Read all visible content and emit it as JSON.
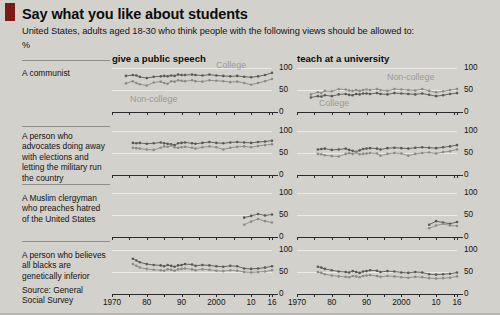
{
  "header": {
    "title": "Say what you like about students",
    "subtitle": "United States, adults aged 18-30 who think people with the following views should be allowed to:",
    "unit": "%"
  },
  "columns": [
    {
      "id": "speech",
      "label": "give a public speech"
    },
    {
      "id": "teach",
      "label": "teach at a university"
    }
  ],
  "source": "Source: General\nSocial Survey",
  "source_line1": "Source: General",
  "source_line2": "Social Survey",
  "colors": {
    "accent": "#7d1a14",
    "background": "#d3d1cb",
    "gridline": "#ebeae6",
    "axis": "#2a2a2a",
    "college": "#5a5954",
    "noncollege": "#8d8b86",
    "series_label": "#9c9a95"
  },
  "axis": {
    "y_ticks": [
      "0",
      "50",
      "100"
    ],
    "y_min": 0,
    "y_max": 100,
    "x_min": 1970,
    "x_max": 2016,
    "x_tick_labels": [
      "1970",
      "80",
      "90",
      "2000",
      "10",
      "16"
    ],
    "x_tick_values": [
      1970,
      1980,
      1990,
      2000,
      2010,
      2016
    ],
    "x_minor_ticks": [
      1970,
      1975,
      1980,
      1985,
      1990,
      1995,
      2000,
      2005,
      2010,
      2015,
      2016
    ]
  },
  "rows": [
    {
      "id": "communist",
      "label": "A communist"
    },
    {
      "id": "military",
      "label": "A person who advocates doing away with elections and letting the military run the country"
    },
    {
      "id": "muslim",
      "label": "A Muslim clergyman who preaches hatred of the United States"
    },
    {
      "id": "racist",
      "label": "A person who believes all blacks are genetically inferior"
    }
  ],
  "series_annotations": {
    "speech_communist_college": "College",
    "speech_communist_noncollege": "Non-college",
    "teach_communist_noncollege": "Non-college",
    "teach_communist_college": "College"
  },
  "chart_data": {
    "type": "line",
    "title": "Say what you like about students",
    "subtitle": "United States, adults aged 18-30 who think people with the following views should be allowed to:",
    "ylabel": "%",
    "xlabel": "",
    "ylim": [
      0,
      100
    ],
    "xlim": [
      1970,
      2016
    ],
    "grid": true,
    "legend": "inline-annotations",
    "panels": [
      {
        "row": "A communist",
        "column": "give a public speech",
        "series": [
          {
            "name": "College",
            "color": "#5a5954",
            "x": [
              1974,
              1976,
              1977,
              1978,
              1980,
              1982,
              1984,
              1985,
              1986,
              1987,
              1988,
              1989,
              1990,
              1991,
              1993,
              1994,
              1996,
              1998,
              2000,
              2002,
              2004,
              2006,
              2008,
              2010,
              2012,
              2014,
              2016
            ],
            "values": [
              82,
              84,
              83,
              80,
              77,
              80,
              81,
              82,
              81,
              83,
              82,
              85,
              84,
              84,
              85,
              84,
              83,
              85,
              83,
              82,
              81,
              82,
              80,
              79,
              81,
              84,
              89
            ]
          },
          {
            "name": "Non-college",
            "color": "#8d8b86",
            "x": [
              1974,
              1976,
              1977,
              1978,
              1980,
              1982,
              1984,
              1985,
              1986,
              1987,
              1988,
              1989,
              1990,
              1991,
              1993,
              1994,
              1996,
              1998,
              2000,
              2002,
              2004,
              2006,
              2008,
              2010,
              2012,
              2014,
              2016
            ],
            "values": [
              65,
              70,
              66,
              63,
              60,
              67,
              69,
              66,
              64,
              70,
              69,
              72,
              71,
              70,
              72,
              70,
              69,
              72,
              71,
              70,
              68,
              69,
              66,
              62,
              66,
              70,
              75
            ]
          }
        ]
      },
      {
        "row": "A communist",
        "column": "teach at a university",
        "series": [
          {
            "name": "Non-college",
            "color": "#8d8b86",
            "x": [
              1974,
              1976,
              1977,
              1978,
              1980,
              1982,
              1984,
              1985,
              1986,
              1987,
              1988,
              1989,
              1990,
              1991,
              1993,
              1994,
              1996,
              1998,
              2000,
              2002,
              2004,
              2006,
              2008,
              2010,
              2012,
              2014,
              2016
            ],
            "values": [
              40,
              45,
              43,
              48,
              47,
              52,
              51,
              49,
              48,
              50,
              48,
              50,
              51,
              50,
              52,
              50,
              48,
              52,
              51,
              50,
              49,
              52,
              48,
              45,
              47,
              50,
              52
            ]
          },
          {
            "name": "College",
            "color": "#5a5954",
            "x": [
              1974,
              1976,
              1977,
              1978,
              1980,
              1982,
              1984,
              1985,
              1986,
              1987,
              1988,
              1989,
              1990,
              1991,
              1993,
              1994,
              1996,
              1998,
              2000,
              2002,
              2004,
              2006,
              2008,
              2010,
              2012,
              2014,
              2016
            ],
            "values": [
              33,
              36,
              35,
              38,
              36,
              40,
              41,
              39,
              38,
              41,
              40,
              42,
              42,
              41,
              43,
              41,
              40,
              43,
              42,
              41,
              40,
              42,
              39,
              36,
              38,
              41,
              43
            ]
          }
        ]
      },
      {
        "row": "A person who advocates doing away with elections and letting the military run the country",
        "column": "give a public speech",
        "series": [
          {
            "name": "College",
            "color": "#5a5954",
            "x": [
              1976,
              1977,
              1978,
              1980,
              1982,
              1984,
              1985,
              1986,
              1987,
              1988,
              1989,
              1990,
              1991,
              1993,
              1994,
              1996,
              1998,
              2000,
              2002,
              2004,
              2006,
              2008,
              2010,
              2012,
              2014,
              2016
            ],
            "values": [
              73,
              72,
              73,
              71,
              72,
              74,
              72,
              71,
              70,
              68,
              72,
              73,
              74,
              72,
              71,
              73,
              75,
              73,
              72,
              74,
              75,
              74,
              73,
              75,
              76,
              78
            ]
          },
          {
            "name": "Non-college",
            "color": "#8d8b86",
            "x": [
              1976,
              1977,
              1978,
              1980,
              1982,
              1984,
              1985,
              1986,
              1987,
              1988,
              1989,
              1990,
              1991,
              1993,
              1994,
              1996,
              1998,
              2000,
              2002,
              2004,
              2006,
              2008,
              2010,
              2012,
              2014,
              2016
            ],
            "values": [
              62,
              61,
              60,
              58,
              57,
              62,
              65,
              64,
              67,
              63,
              62,
              63,
              64,
              62,
              60,
              63,
              65,
              63,
              58,
              62,
              64,
              65,
              63,
              66,
              68,
              70
            ]
          }
        ]
      },
      {
        "row": "A person who advocates doing away with elections and letting the military run the country",
        "column": "teach at a university",
        "series": [
          {
            "name": "College",
            "color": "#5a5954",
            "x": [
              1976,
              1977,
              1978,
              1980,
              1982,
              1984,
              1985,
              1986,
              1987,
              1988,
              1989,
              1990,
              1991,
              1993,
              1994,
              1996,
              1998,
              2000,
              2002,
              2004,
              2006,
              2008,
              2010,
              2012,
              2014,
              2016
            ],
            "values": [
              58,
              59,
              60,
              57,
              58,
              60,
              57,
              55,
              53,
              56,
              59,
              60,
              61,
              60,
              58,
              61,
              62,
              61,
              60,
              62,
              63,
              62,
              61,
              63,
              65,
              68
            ]
          },
          {
            "name": "Non-college",
            "color": "#8d8b86",
            "x": [
              1976,
              1977,
              1978,
              1980,
              1982,
              1984,
              1985,
              1986,
              1987,
              1988,
              1989,
              1990,
              1991,
              1993,
              1994,
              1996,
              1998,
              2000,
              2002,
              2004,
              2006,
              2008,
              2010,
              2012,
              2014,
              2016
            ],
            "values": [
              48,
              47,
              45,
              43,
              42,
              48,
              50,
              48,
              51,
              47,
              48,
              49,
              50,
              49,
              44,
              48,
              50,
              49,
              44,
              48,
              50,
              51,
              49,
              52,
              54,
              58
            ]
          }
        ]
      },
      {
        "row": "A Muslim clergyman who preaches hatred of the United States",
        "column": "give a public speech",
        "series": [
          {
            "name": "College",
            "color": "#5a5954",
            "x": [
              2008,
              2010,
              2012,
              2014,
              2016
            ],
            "values": [
              44,
              48,
              52,
              49,
              51
            ]
          },
          {
            "name": "Non-college",
            "color": "#8d8b86",
            "x": [
              2008,
              2010,
              2012,
              2014,
              2016
            ],
            "values": [
              28,
              35,
              41,
              36,
              33
            ]
          }
        ]
      },
      {
        "row": "A Muslim clergyman who preaches hatred of the United States",
        "column": "teach at a university",
        "series": [
          {
            "name": "College",
            "color": "#5a5954",
            "x": [
              2008,
              2010,
              2012,
              2014,
              2016
            ],
            "values": [
              28,
              36,
              33,
              30,
              34
            ]
          },
          {
            "name": "Non-college",
            "color": "#8d8b86",
            "x": [
              2008,
              2010,
              2012,
              2014,
              2016
            ],
            "values": [
              20,
              26,
              30,
              26,
              25
            ]
          }
        ]
      },
      {
        "row": "A person who believes all blacks are genetically inferior",
        "column": "give a public speech",
        "series": [
          {
            "name": "College",
            "color": "#5a5954",
            "x": [
              1976,
              1977,
              1978,
              1980,
              1982,
              1984,
              1985,
              1986,
              1987,
              1988,
              1989,
              1990,
              1991,
              1993,
              1994,
              1996,
              1998,
              2000,
              2002,
              2004,
              2006,
              2008,
              2010,
              2012,
              2014,
              2016
            ],
            "values": [
              80,
              76,
              72,
              68,
              66,
              65,
              63,
              66,
              64,
              62,
              65,
              66,
              68,
              67,
              64,
              66,
              65,
              63,
              62,
              64,
              63,
              58,
              57,
              58,
              60,
              63
            ]
          },
          {
            "name": "Non-college",
            "color": "#8d8b86",
            "x": [
              1976,
              1977,
              1978,
              1980,
              1982,
              1984,
              1985,
              1986,
              1987,
              1988,
              1989,
              1990,
              1991,
              1993,
              1994,
              1996,
              1998,
              2000,
              2002,
              2004,
              2006,
              2008,
              2010,
              2012,
              2014,
              2016
            ],
            "values": [
              68,
              64,
              60,
              57,
              55,
              54,
              53,
              56,
              55,
              53,
              56,
              57,
              58,
              56,
              54,
              56,
              55,
              53,
              52,
              54,
              53,
              50,
              49,
              50,
              51,
              54
            ]
          }
        ]
      },
      {
        "row": "A person who believes all blacks are genetically inferior",
        "column": "teach at a university",
        "series": [
          {
            "name": "College",
            "color": "#5a5954",
            "x": [
              1976,
              1977,
              1978,
              1980,
              1982,
              1984,
              1985,
              1986,
              1987,
              1988,
              1989,
              1990,
              1991,
              1993,
              1994,
              1996,
              1998,
              2000,
              2002,
              2004,
              2006,
              2008,
              2010,
              2012,
              2014,
              2016
            ],
            "values": [
              62,
              60,
              57,
              54,
              51,
              50,
              49,
              52,
              50,
              48,
              51,
              52,
              54,
              53,
              50,
              52,
              51,
              49,
              48,
              50,
              49,
              45,
              44,
              45,
              46,
              49
            ]
          },
          {
            "name": "Non-college",
            "color": "#8d8b86",
            "x": [
              1976,
              1977,
              1978,
              1980,
              1982,
              1984,
              1985,
              1986,
              1987,
              1988,
              1989,
              1990,
              1991,
              1993,
              1994,
              1996,
              1998,
              2000,
              2002,
              2004,
              2006,
              2008,
              2010,
              2012,
              2014,
              2016
            ],
            "values": [
              50,
              48,
              45,
              42,
              40,
              39,
              38,
              41,
              40,
              38,
              41,
              42,
              43,
              41,
              39,
              41,
              40,
              38,
              37,
              39,
              38,
              36,
              35,
              36,
              37,
              40
            ]
          }
        ]
      }
    ]
  }
}
